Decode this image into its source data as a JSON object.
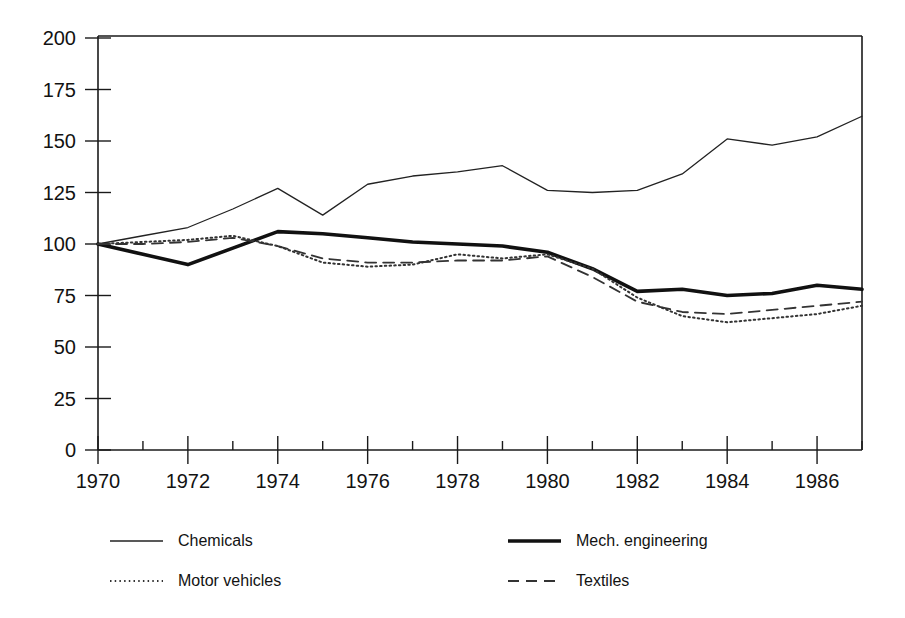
{
  "chart_data": {
    "type": "line",
    "title": "",
    "subtitle": "",
    "xlabel": "",
    "ylabel": "",
    "xlim": [
      1970,
      1987
    ],
    "ylim": [
      0,
      200
    ],
    "grid": false,
    "legend_position": "below",
    "x": [
      1970,
      1971,
      1972,
      1973,
      1974,
      1975,
      1976,
      1977,
      1978,
      1979,
      1980,
      1981,
      1982,
      1983,
      1984,
      1985,
      1986,
      1987
    ],
    "xticks_major": [
      1970,
      1972,
      1974,
      1976,
      1978,
      1980,
      1982,
      1984,
      1986
    ],
    "xtick_labels": [
      "1970",
      "1972",
      "1974",
      "1976",
      "1978",
      "1980",
      "1982",
      "1984",
      "1986"
    ],
    "xticks_minor": [
      1971,
      1973,
      1975,
      1977,
      1979,
      1981,
      1983,
      1985,
      1987
    ],
    "yticks": [
      0,
      25,
      50,
      75,
      100,
      125,
      150,
      175,
      200
    ],
    "ytick_labels": [
      "0",
      "25",
      "50",
      "75",
      "100",
      "125",
      "150",
      "175",
      "200"
    ],
    "series": [
      {
        "name": "Chemicals",
        "style": "solid-thin",
        "color": "#222222",
        "width": 1.3,
        "dash": "",
        "values": [
          100,
          104,
          108,
          117,
          127,
          114,
          129,
          133,
          135,
          138,
          126,
          125,
          126,
          134,
          151,
          148,
          152,
          162
        ]
      },
      {
        "name": "Mech. engineering",
        "style": "solid-thick",
        "color": "#111111",
        "width": 3.6,
        "dash": "",
        "values": [
          100,
          95,
          90,
          98,
          106,
          105,
          103,
          101,
          100,
          99,
          96,
          88,
          77,
          78,
          75,
          76,
          80,
          78
        ]
      },
      {
        "name": "Motor vehicles",
        "style": "dotted",
        "color": "#333333",
        "width": 2.0,
        "dash": "1.5 3.2",
        "values": [
          100,
          101,
          102,
          104,
          99,
          91,
          89,
          90,
          95,
          93,
          95,
          88,
          74,
          65,
          62,
          64,
          66,
          70
        ]
      },
      {
        "name": "Textiles",
        "style": "dashed",
        "color": "#333333",
        "width": 1.8,
        "dash": "11 7",
        "values": [
          100,
          100,
          101,
          103,
          99,
          93,
          91,
          91,
          92,
          92,
          94,
          84,
          72,
          67,
          66,
          68,
          70,
          72
        ]
      }
    ]
  },
  "legend": {
    "entries": [
      {
        "label": "Chemicals",
        "series": "Chemicals"
      },
      {
        "label": "Mech. engineering",
        "series": "Mech. engineering"
      },
      {
        "label": "Motor vehicles",
        "series": "Motor vehicles"
      },
      {
        "label": "Textiles",
        "series": "Textiles"
      }
    ]
  }
}
